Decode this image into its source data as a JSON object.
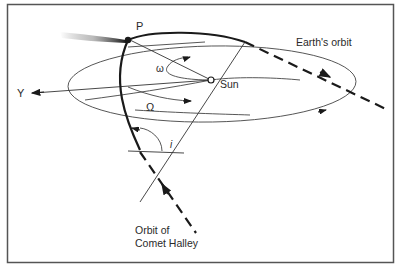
{
  "diagram": {
    "labels": {
      "perihelion": "P",
      "sun": "Sun",
      "earth_orbit": "Earth's orbit",
      "y_axis": "Y",
      "omega_small": "ω",
      "omega_capital": "Ω",
      "inclination": "i",
      "comet_orbit_line1": "Orbit of",
      "comet_orbit_line2": "Comet Halley"
    },
    "colors": {
      "line": "#1a1a1a",
      "thin_line": "#444444",
      "frame": "#555555",
      "background": "#ffffff"
    }
  }
}
